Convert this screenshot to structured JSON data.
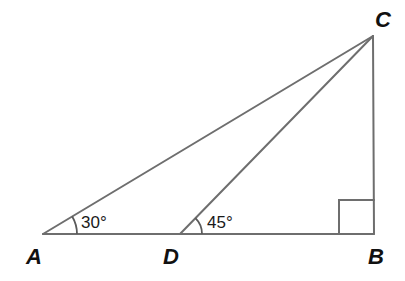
{
  "diagram": {
    "type": "geometry-triangle",
    "colors": {
      "stroke": "#6e6e6e",
      "text": "#111111",
      "background": "#ffffff"
    },
    "vertices": [
      {
        "id": "A",
        "label": "A",
        "x": 43,
        "y": 234
      },
      {
        "id": "D",
        "label": "D",
        "x": 180,
        "y": 234
      },
      {
        "id": "B",
        "label": "B",
        "x": 374,
        "y": 234
      },
      {
        "id": "C",
        "label": "C",
        "x": 373,
        "y": 36
      }
    ],
    "segments": [
      "AB",
      "AC",
      "DC",
      "BC"
    ],
    "angles": [
      {
        "at": "A",
        "label": "30°"
      },
      {
        "at": "D",
        "label": "45°"
      },
      {
        "at": "B",
        "label": "right-angle"
      }
    ]
  }
}
